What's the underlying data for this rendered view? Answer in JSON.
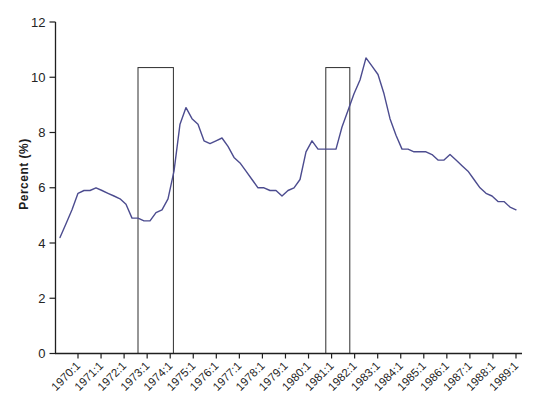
{
  "chart_data": {
    "type": "line",
    "title": "",
    "xlabel": "",
    "ylabel": "Percent (%)",
    "ylim": [
      0,
      12
    ],
    "y_ticks": [
      0,
      2,
      4,
      6,
      8,
      10,
      12
    ],
    "x_tick_labels": [
      "1970:1",
      "1971:1",
      "1972:1",
      "1973:1",
      "1974:1",
      "1975:1",
      "1976:1",
      "1977:1",
      "1978:1",
      "1979:1",
      "1980:1",
      "1981:1",
      "1982:1",
      "1983:1",
      "1984:1",
      "1985:1",
      "1986:1",
      "1987:1",
      "1988:1",
      "1989:1"
    ],
    "grid": false,
    "legend": false,
    "series": [
      {
        "start_label": "1970:1",
        "end_label": "1989:1",
        "frequency": "quarterly",
        "values": [
          4.2,
          4.7,
          5.2,
          5.8,
          5.9,
          5.9,
          6.0,
          5.9,
          5.8,
          5.7,
          5.6,
          5.4,
          4.9,
          4.9,
          4.8,
          4.8,
          5.1,
          5.2,
          5.6,
          6.6,
          8.3,
          8.9,
          8.5,
          8.3,
          7.7,
          7.6,
          7.7,
          7.8,
          7.5,
          7.1,
          6.9,
          6.6,
          6.3,
          6.0,
          6.0,
          5.9,
          5.9,
          5.7,
          5.9,
          6.0,
          6.3,
          7.3,
          7.7,
          7.4,
          7.4,
          7.4,
          7.4,
          8.2,
          8.8,
          9.4,
          9.9,
          10.7,
          10.4,
          10.1,
          9.4,
          8.5,
          7.9,
          7.4,
          7.4,
          7.3,
          7.3,
          7.3,
          7.2,
          7.0,
          7.0,
          7.2,
          7.0,
          6.8,
          6.6,
          6.3,
          6.0,
          5.8,
          5.7,
          5.5,
          5.5,
          5.3,
          5.2
        ]
      }
    ],
    "highlight_boxes": [
      {
        "start_idx": 13.0,
        "end_idx": 18.9,
        "top_value": 10.35
      },
      {
        "start_idx": 44.3,
        "end_idx": 48.3,
        "top_value": 10.35
      }
    ],
    "line_color": "#4c4c8f",
    "axis_color": "#1f1f1f",
    "box_color": "#2e2e2e"
  }
}
